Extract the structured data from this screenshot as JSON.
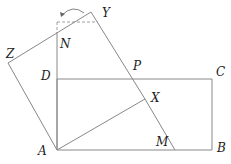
{
  "diagram": {
    "points": {
      "A": {
        "label": "A",
        "x": 57,
        "y": 150,
        "lx": 38,
        "ly": 155
      },
      "B": {
        "label": "B",
        "x": 212,
        "y": 150,
        "lx": 217,
        "ly": 152
      },
      "C": {
        "label": "C",
        "x": 212,
        "y": 79,
        "lx": 216,
        "ly": 76
      },
      "D": {
        "label": "D",
        "x": 57,
        "y": 79,
        "lx": 41,
        "ly": 80
      },
      "M": {
        "label": "M",
        "x": 175,
        "y": 150,
        "lx": 156,
        "ly": 146
      },
      "X": {
        "label": "X",
        "x": 145,
        "y": 99,
        "lx": 151,
        "ly": 102
      },
      "P": {
        "label": "P",
        "x": 133,
        "y": 79,
        "lx": 133,
        "ly": 70
      },
      "Y": {
        "label": "Y",
        "x": 91,
        "y": 12,
        "lx": 102,
        "ly": 17
      },
      "Z": {
        "label": "Z",
        "x": 8,
        "y": 63,
        "lx": 6,
        "ly": 58
      },
      "N": {
        "label": "N",
        "x": 57,
        "y": 32,
        "lx": 60,
        "ly": 48
      }
    },
    "stroke_color": "#888888",
    "label_color": "#222222"
  }
}
